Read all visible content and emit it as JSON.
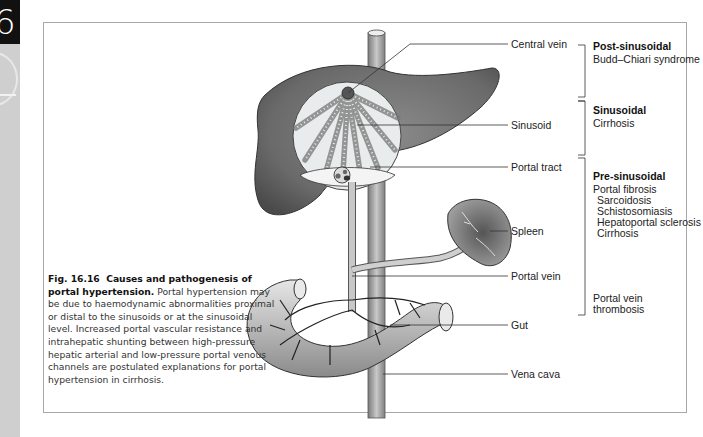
{
  "page_tab": {
    "chapter_number": "6"
  },
  "figure": {
    "number": "Fig. 16.16",
    "title": "Causes and pathogenesis of portal hypertension.",
    "caption_body": "Portal hypertension may be due to haemodynamic abnormalities proximal or distal to the sinusoids or at the sinusoidal level. Increased portal vascular resistance and intrahepatic shunting between high-pressure hepatic arterial and low-pressure portal venous channels are postulated explanations for portal hypertension in cirrhosis."
  },
  "anatomy_labels": [
    {
      "id": "central-vein",
      "text": "Central vein"
    },
    {
      "id": "sinusoid",
      "text": "Sinusoid"
    },
    {
      "id": "portal-tract",
      "text": "Portal tract"
    },
    {
      "id": "spleen",
      "text": "Spleen"
    },
    {
      "id": "portal-vein",
      "text": "Portal vein"
    },
    {
      "id": "gut",
      "text": "Gut"
    },
    {
      "id": "vena-cava",
      "text": "Vena cava"
    }
  ],
  "categories": [
    {
      "title": "Post-sinusoidal",
      "items": [
        "Budd–Chiari syndrome"
      ],
      "sub_items": []
    },
    {
      "title": "Sinusoidal",
      "items": [
        "Cirrhosis"
      ],
      "sub_items": []
    },
    {
      "title": "Pre-sinusoidal",
      "items": [
        "Portal fibrosis"
      ],
      "sub_items": [
        "Sarcoidosis",
        "Schistosomiasis",
        "Hepatoportal sclerosis",
        "Cirrhosis"
      ]
    },
    {
      "title": "",
      "items": [
        "Portal vein",
        "thrombosis"
      ],
      "sub_items": []
    }
  ],
  "colors": {
    "liver": "#6e6e6e",
    "vessel": "#a9a9a9",
    "frame": "#a8a8a8",
    "leader_line": "#333333"
  }
}
